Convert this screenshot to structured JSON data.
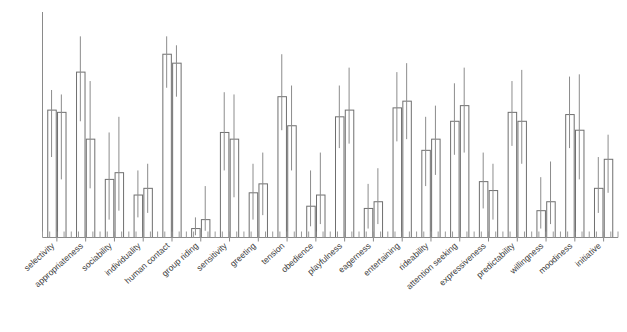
{
  "chart_data": {
    "type": "bar",
    "title": "",
    "subtitle": "",
    "xlabel": "",
    "ylabel": "",
    "ylim": [
      0,
      100
    ],
    "grid": false,
    "legend": false,
    "legend_position": "none",
    "orientation": "vertical",
    "error_bars": true,
    "error_bar_style": "vertical-line-range",
    "axis_ticks_visible": true,
    "y_tick_labels": [],
    "x_tick_labels_rotation_deg": -42,
    "categories": [
      "selectivity",
      "appropriateness",
      "sociability",
      "individuality",
      "human contact",
      "group riding",
      "sensitivity",
      "greeting",
      "tension",
      "obedience",
      "playfulness",
      "eagerness",
      "entertaining",
      "rideability",
      "attention seeking",
      "expressiveness",
      "predictability",
      "willingness",
      "moodiness",
      "initiative"
    ],
    "series": [
      {
        "name": "series-1",
        "values": [
          57,
          74,
          26,
          19,
          82,
          4,
          47,
          20,
          63,
          14,
          54,
          13,
          58,
          39,
          52,
          25,
          56,
          12,
          55,
          22
        ],
        "err_low": [
          36,
          52,
          8,
          9,
          67,
          1,
          30,
          8,
          48,
          5,
          40,
          4,
          43,
          23,
          37,
          13,
          41,
          4,
          40,
          11
        ],
        "err_high": [
          66,
          90,
          47,
          30,
          90,
          9,
          65,
          33,
          82,
          30,
          68,
          24,
          74,
          54,
          69,
          38,
          70,
          27,
          72,
          36
        ]
      },
      {
        "name": "series-2",
        "values": [
          56,
          44,
          29,
          22,
          78,
          8,
          44,
          24,
          50,
          19,
          57,
          16,
          61,
          44,
          59,
          21,
          52,
          16,
          48,
          35
        ],
        "err_low": [
          26,
          22,
          12,
          11,
          63,
          3,
          18,
          10,
          30,
          6,
          42,
          6,
          44,
          28,
          38,
          8,
          33,
          6,
          26,
          20
        ],
        "err_high": [
          64,
          70,
          54,
          33,
          86,
          23,
          64,
          38,
          68,
          38,
          76,
          31,
          78,
          59,
          76,
          33,
          75,
          34,
          73,
          46
        ]
      }
    ]
  },
  "axis": {
    "y_axis_name": "y-axis",
    "x_axis_name": "x-axis"
  }
}
